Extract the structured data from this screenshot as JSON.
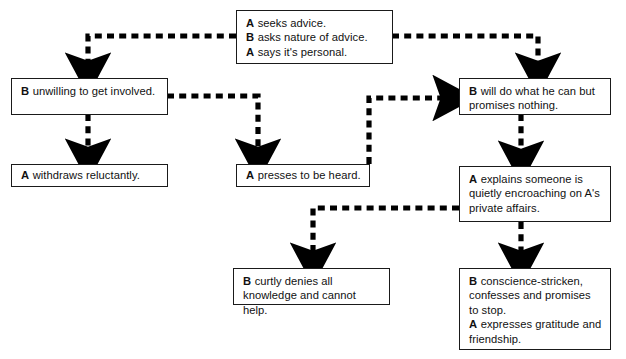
{
  "diagram": {
    "background_color": "#ffffff",
    "box_border_color": "#1a1a1a",
    "connector_color": "#000000",
    "connector_style": "dashed-with-arrowhead"
  },
  "nodes": [
    {
      "id": "start",
      "name": "node-seeks-advice",
      "lines": [
        {
          "speaker": "A",
          "text": "seeks advice."
        },
        {
          "speaker": "B",
          "text": "asks nature of advice."
        },
        {
          "speaker": "A",
          "text": "says it's personal."
        }
      ]
    },
    {
      "id": "unwilling",
      "name": "node-unwilling-to-get-involved",
      "lines": [
        {
          "speaker": "B",
          "text": "unwilling to get involved."
        }
      ]
    },
    {
      "id": "will-do",
      "name": "node-will-do-what-he-can",
      "lines": [
        {
          "speaker": "B",
          "text": "will do what he can but promises nothing."
        }
      ]
    },
    {
      "id": "withdraws",
      "name": "node-withdraws-reluctantly",
      "lines": [
        {
          "speaker": "A",
          "text": "withdraws reluctantly."
        }
      ]
    },
    {
      "id": "presses",
      "name": "node-presses-to-be-heard",
      "lines": [
        {
          "speaker": "A",
          "text": "presses to be heard."
        }
      ]
    },
    {
      "id": "explains",
      "name": "node-explains-encroaching",
      "lines": [
        {
          "speaker": "A",
          "text": "explains someone is quietly encroaching on A's private affairs."
        }
      ]
    },
    {
      "id": "denies",
      "name": "node-curtly-denies-all",
      "lines": [
        {
          "speaker": "B",
          "text": "curtly denies all knowledge and cannot help."
        }
      ]
    },
    {
      "id": "conscience",
      "name": "node-conscience-stricken",
      "lines": [
        {
          "speaker": "B",
          "text": "conscience-stricken, confesses and promises to stop."
        },
        {
          "speaker": "A",
          "text": "expresses gratitude and friendship."
        }
      ]
    }
  ],
  "edges": [
    {
      "name": "edge-start-to-unwilling",
      "from": "start",
      "to": "unwilling"
    },
    {
      "name": "edge-start-to-will-do",
      "from": "start",
      "to": "will-do"
    },
    {
      "name": "edge-unwilling-to-withdraws",
      "from": "unwilling",
      "to": "withdraws"
    },
    {
      "name": "edge-unwilling-to-presses",
      "from": "unwilling",
      "to": "presses"
    },
    {
      "name": "edge-presses-to-will-do",
      "from": "presses",
      "to": "will-do"
    },
    {
      "name": "edge-will-do-to-explains",
      "from": "will-do",
      "to": "explains"
    },
    {
      "name": "edge-explains-to-denies",
      "from": "explains",
      "to": "denies"
    },
    {
      "name": "edge-explains-to-conscience",
      "from": "explains",
      "to": "conscience"
    }
  ]
}
